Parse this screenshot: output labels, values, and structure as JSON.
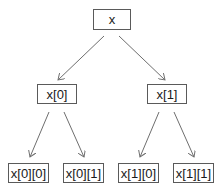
{
  "diagram": {
    "type": "tree",
    "colors": {
      "edge": "#6e6e6e",
      "node_border": "#5a5a5a",
      "text": "#1a1a1a",
      "background": "#ffffff"
    },
    "nodes": [
      {
        "id": "x",
        "label": "x",
        "level": 0
      },
      {
        "id": "x0",
        "label": "x[0]",
        "level": 1,
        "parent": "x"
      },
      {
        "id": "x1",
        "label": "x[1]",
        "level": 1,
        "parent": "x"
      },
      {
        "id": "x00",
        "label": "x[0][0]",
        "level": 2,
        "parent": "x0"
      },
      {
        "id": "x01",
        "label": "x[0][1]",
        "level": 2,
        "parent": "x0"
      },
      {
        "id": "x10",
        "label": "x[1][0]",
        "level": 2,
        "parent": "x1"
      },
      {
        "id": "x11",
        "label": "x[1][1]",
        "level": 2,
        "parent": "x1"
      }
    ],
    "edges": [
      {
        "from": "x",
        "to": "x0"
      },
      {
        "from": "x",
        "to": "x1"
      },
      {
        "from": "x0",
        "to": "x00"
      },
      {
        "from": "x0",
        "to": "x01"
      },
      {
        "from": "x1",
        "to": "x10"
      },
      {
        "from": "x1",
        "to": "x11"
      }
    ]
  }
}
